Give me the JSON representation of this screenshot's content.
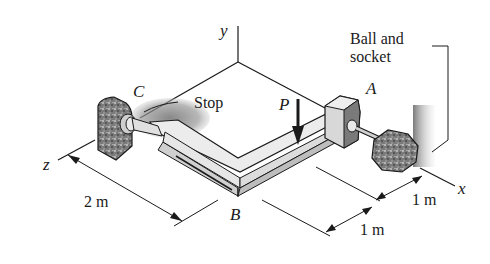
{
  "figure": {
    "type": "engineering-statics-diagram"
  },
  "axes": {
    "x": "x",
    "y": "y",
    "z": "z"
  },
  "points": {
    "A": "A",
    "B": "B",
    "C": "C"
  },
  "load": {
    "label": "P",
    "direction": "downward (-y)"
  },
  "annotations": {
    "stop": "Stop",
    "ball_socket_line1": "Ball and",
    "ball_socket_line2": "socket"
  },
  "dimensions": {
    "zB": "2 m",
    "xPB": "1 m",
    "xAP": "1 m"
  },
  "colors": {
    "ink": "#1a1a1a",
    "bar_fill": "#e8e8e8",
    "bar_edge": "#bdbdbd",
    "support_fill": "#8a8a8a",
    "support_dark": "#3a3a3a",
    "background": "#ffffff"
  }
}
